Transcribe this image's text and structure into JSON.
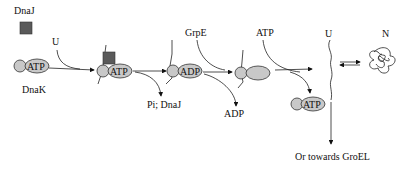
{
  "diagram": {
    "labels": {
      "dnaj_top": "DnaJ",
      "dnak": "DnaK",
      "u_first": "U",
      "pi_dnaj": "Pi; DnaJ",
      "grpe": "GrpE",
      "adp_release": "ADP",
      "atp_input": "ATP",
      "u_released": "U",
      "n_native": "N",
      "groel": "Or towards GroEL"
    },
    "complexes": {
      "dnak_atp": "ATP",
      "dnak_j_u_atp": "ATP",
      "dnak_u_adp": "ADP",
      "dnak_atp_regenerated": "ATP"
    },
    "colors": {
      "protein_fill": "#c8c8c8",
      "dnaj_fill": "#5a5a5a",
      "line": "#222222"
    }
  }
}
